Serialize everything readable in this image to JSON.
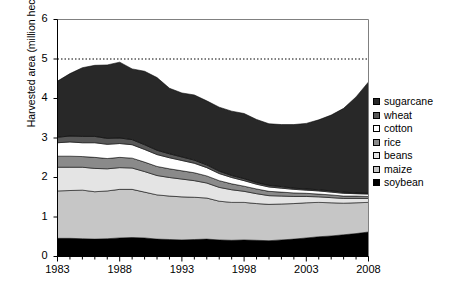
{
  "chart_data": {
    "type": "area",
    "stacked": true,
    "title": "",
    "xlabel": "",
    "ylabel": "Harvested area (million hectares)",
    "xlim": [
      1983,
      2008
    ],
    "ylim": [
      0,
      6
    ],
    "yticks": [
      0,
      1,
      2,
      3,
      4,
      5,
      6
    ],
    "ytick_labels": [
      "0",
      "1",
      "2",
      "3",
      "4",
      "5",
      "6"
    ],
    "xticks": [
      1983,
      1988,
      1993,
      1998,
      2003,
      2008
    ],
    "xtick_labels": [
      "1983",
      "1988",
      "1993",
      "1998",
      "2003",
      "2008"
    ],
    "minor_xticks_every": 1,
    "grid": false,
    "legend_position": "right",
    "reference_line": {
      "y": 5,
      "style": "dotted",
      "color": "#000000"
    },
    "x": [
      1983,
      1984,
      1985,
      1986,
      1987,
      1988,
      1989,
      1990,
      1991,
      1992,
      1993,
      1994,
      1995,
      1996,
      1997,
      1998,
      1999,
      2000,
      2001,
      2002,
      2003,
      2004,
      2005,
      2006,
      2007,
      2008
    ],
    "series": [
      {
        "name": "soybean",
        "color": "#000000",
        "values": [
          0.46,
          0.46,
          0.45,
          0.44,
          0.45,
          0.47,
          0.48,
          0.47,
          0.44,
          0.43,
          0.42,
          0.43,
          0.44,
          0.42,
          0.41,
          0.42,
          0.41,
          0.4,
          0.42,
          0.44,
          0.47,
          0.5,
          0.52,
          0.55,
          0.58,
          0.62
        ]
      },
      {
        "name": "maize",
        "color": "#c6c6c6",
        "values": [
          1.2,
          1.21,
          1.23,
          1.2,
          1.21,
          1.23,
          1.22,
          1.16,
          1.12,
          1.1,
          1.09,
          1.07,
          1.04,
          0.98,
          0.96,
          0.95,
          0.93,
          0.92,
          0.91,
          0.9,
          0.89,
          0.87,
          0.84,
          0.8,
          0.78,
          0.75
        ]
      },
      {
        "name": "beans",
        "color": "#e4e4e4",
        "values": [
          0.6,
          0.59,
          0.58,
          0.59,
          0.56,
          0.55,
          0.54,
          0.52,
          0.49,
          0.47,
          0.45,
          0.42,
          0.38,
          0.35,
          0.32,
          0.28,
          0.25,
          0.22,
          0.2,
          0.18,
          0.16,
          0.14,
          0.13,
          0.12,
          0.11,
          0.1
        ]
      },
      {
        "name": "rice",
        "color": "#8a8a8a",
        "values": [
          0.28,
          0.28,
          0.27,
          0.28,
          0.26,
          0.26,
          0.25,
          0.24,
          0.23,
          0.22,
          0.21,
          0.2,
          0.18,
          0.17,
          0.15,
          0.13,
          0.12,
          0.11,
          0.1,
          0.09,
          0.08,
          0.07,
          0.07,
          0.06,
          0.06,
          0.05
        ]
      },
      {
        "name": "cotton",
        "color": "#ffffff",
        "values": [
          0.34,
          0.36,
          0.35,
          0.37,
          0.36,
          0.35,
          0.34,
          0.32,
          0.3,
          0.28,
          0.26,
          0.24,
          0.21,
          0.18,
          0.16,
          0.14,
          0.12,
          0.11,
          0.1,
          0.09,
          0.08,
          0.08,
          0.07,
          0.07,
          0.06,
          0.06
        ]
      },
      {
        "name": "wheat",
        "color": "#585858",
        "values": [
          0.14,
          0.15,
          0.16,
          0.16,
          0.15,
          0.14,
          0.13,
          0.12,
          0.11,
          0.1,
          0.09,
          0.08,
          0.07,
          0.06,
          0.05,
          0.05,
          0.04,
          0.04,
          0.04,
          0.03,
          0.03,
          0.03,
          0.03,
          0.03,
          0.02,
          0.02
        ]
      },
      {
        "name": "sugarcane",
        "color": "#282828",
        "values": [
          1.42,
          1.58,
          1.74,
          1.8,
          1.86,
          1.92,
          1.79,
          1.86,
          1.84,
          1.66,
          1.62,
          1.65,
          1.62,
          1.62,
          1.63,
          1.65,
          1.6,
          1.56,
          1.57,
          1.61,
          1.66,
          1.77,
          1.92,
          2.12,
          2.43,
          2.82
        ]
      }
    ]
  },
  "legend": {
    "items": [
      {
        "label": "sugarcane",
        "color": "#282828"
      },
      {
        "label": "wheat",
        "color": "#585858"
      },
      {
        "label": "cotton",
        "color": "#ffffff"
      },
      {
        "label": "rice",
        "color": "#8a8a8a"
      },
      {
        "label": "beans",
        "color": "#e4e4e4"
      },
      {
        "label": "maize",
        "color": "#c6c6c6"
      },
      {
        "label": "soybean",
        "color": "#000000"
      }
    ]
  }
}
